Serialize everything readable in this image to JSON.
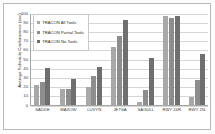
{
  "chart_data": {
    "type": "bar",
    "title": "",
    "xlabel": "",
    "ylabel": "Average Schedule Conformance (sec)",
    "ylim": [
      0,
      100
    ],
    "ytick_labels": [
      "100",
      "90",
      "80",
      "70",
      "60",
      "50",
      "40",
      "30",
      "20",
      "10",
      "0"
    ],
    "grid": true,
    "legend_position": "upper-left-inside",
    "categories": [
      "SADDE",
      "MAXOW",
      "LUVYN",
      "JETSA",
      "SAGULL",
      "RWY 24R",
      "RWY 25L"
    ],
    "series": [
      {
        "name": "TRACON All Tools",
        "color": "#a8a8a8",
        "values": [
          21,
          17,
          19,
          63,
          3,
          96,
          8
        ]
      },
      {
        "name": "TRACON Partial Tools",
        "color": "#8d8d8d",
        "values": [
          25,
          17,
          31,
          75,
          16,
          94,
          27
        ]
      },
      {
        "name": "TRACON No Tools",
        "color": "#6f6f6f",
        "values": [
          40,
          28,
          41,
          92,
          51,
          96,
          55
        ]
      }
    ]
  }
}
